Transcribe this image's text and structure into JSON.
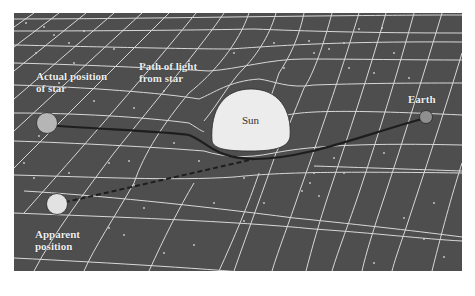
{
  "diagram": {
    "type": "gravitational-lensing-illustration",
    "colors": {
      "background": "#4e4e4e",
      "grid": "#d8d8d8",
      "sun": "#ececec",
      "star": "#b5b5b5",
      "apparent_star": "#e2e2e2",
      "earth": "#8f8f8f",
      "light_path": "#1e1e1e"
    },
    "labels": {
      "actual_position": [
        "Actual position",
        "of star"
      ],
      "path_of_light": [
        "Path of light",
        "from star"
      ],
      "sun": "Sun",
      "earth": "Earth",
      "apparent_position": [
        "Apparent",
        "position"
      ]
    },
    "legend_lines": {
      "solid": "actual light path (bent around Sun)",
      "dashed": "apparent line of sight"
    }
  }
}
